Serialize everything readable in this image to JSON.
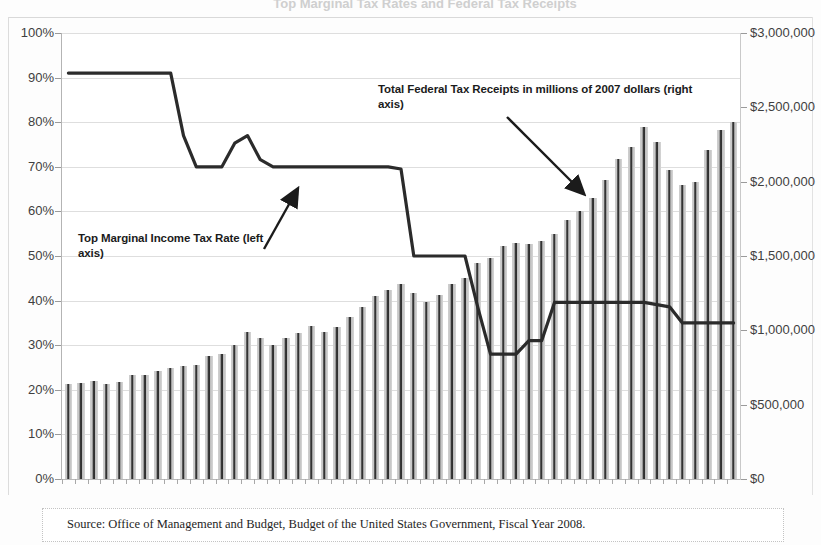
{
  "figure": {
    "ghost_title": "Top Marginal Tax Rates and Federal Tax Receipts",
    "source_note": "Source: Office of Management and Budget, Budget of the United States Government, Fiscal Year 2008."
  },
  "annotations": {
    "receipts": "Total Federal Tax Receipts in millions of 2007 dollars (right axis)",
    "rate": "Top Marginal Income Tax Rate (left axis)"
  },
  "colors": {
    "bar_dark": "#2f2f2f",
    "bar_light": "#cfcfcf",
    "line": "#2b2b2b",
    "grid": "#dedede",
    "text": "#3f3f3f"
  },
  "chart_data": {
    "type": "bar",
    "title": "Top Marginal Tax Rates and Federal Tax Receipts",
    "xlabel": "",
    "ylabel": "Top Marginal Income Tax Rate",
    "y2label": "Total Federal Tax Receipts in millions of 2007 dollars",
    "ylim": [
      0,
      1.0
    ],
    "y2lim": [
      0,
      3000000
    ],
    "grid": true,
    "legend": "annotations",
    "left_ticks": [
      "0%",
      "10%",
      "20%",
      "30%",
      "40%",
      "50%",
      "60%",
      "70%",
      "80%",
      "90%",
      "100%"
    ],
    "left_tick_values": [
      0,
      0.1,
      0.2,
      0.3,
      0.4,
      0.5,
      0.6,
      0.7,
      0.8,
      0.9,
      1.0
    ],
    "right_ticks": [
      "$0",
      "$500,000",
      "$1,000,000",
      "$1,500,000",
      "$2,000,000",
      "$2,500,000",
      "$3,000,000"
    ],
    "right_tick_values": [
      0,
      500000,
      1000000,
      1500000,
      2000000,
      2500000,
      3000000
    ],
    "categories": [
      1955,
      1956,
      1957,
      1958,
      1959,
      1960,
      1961,
      1962,
      1963,
      1964,
      1965,
      1966,
      1967,
      1968,
      1969,
      1970,
      1971,
      1972,
      1973,
      1974,
      1975,
      1976,
      1977,
      1978,
      1979,
      1980,
      1981,
      1982,
      1983,
      1984,
      1985,
      1986,
      1987,
      1988,
      1989,
      1990,
      1991,
      1992,
      1993,
      1994,
      1995,
      1996,
      1997,
      1998,
      1999,
      2000,
      2001,
      2002,
      2003,
      2004,
      2005,
      2006,
      2007
    ],
    "series": [
      {
        "name": "Total Federal Tax Receipts in millions of 2007 dollars (right axis)",
        "axis": "right",
        "render": "bar",
        "values": [
          640000,
          645000,
          660000,
          640000,
          650000,
          700000,
          700000,
          725000,
          750000,
          760000,
          770000,
          830000,
          840000,
          900000,
          990000,
          950000,
          900000,
          950000,
          980000,
          1030000,
          990000,
          1020000,
          1090000,
          1160000,
          1230000,
          1270000,
          1310000,
          1250000,
          1190000,
          1240000,
          1310000,
          1350000,
          1450000,
          1490000,
          1570000,
          1590000,
          1580000,
          1600000,
          1650000,
          1740000,
          1800000,
          1890000,
          2010000,
          2150000,
          2230000,
          2370000,
          2270000,
          2080000,
          1980000,
          2000000,
          2210000,
          2350000,
          2400000
        ]
      },
      {
        "name": "Top Marginal Income Tax Rate (left axis)",
        "axis": "left",
        "render": "line",
        "values": [
          0.91,
          0.91,
          0.91,
          0.91,
          0.91,
          0.91,
          0.91,
          0.91,
          0.91,
          0.77,
          0.7,
          0.7,
          0.7,
          0.753,
          0.77,
          0.716,
          0.7,
          0.7,
          0.7,
          0.7,
          0.7,
          0.7,
          0.7,
          0.7,
          0.7,
          0.7,
          0.695,
          0.5,
          0.5,
          0.5,
          0.5,
          0.5,
          0.385,
          0.28,
          0.28,
          0.28,
          0.31,
          0.31,
          0.396,
          0.396,
          0.396,
          0.396,
          0.396,
          0.396,
          0.396,
          0.396,
          0.391,
          0.386,
          0.35,
          0.35,
          0.35,
          0.35,
          0.35
        ]
      }
    ]
  }
}
